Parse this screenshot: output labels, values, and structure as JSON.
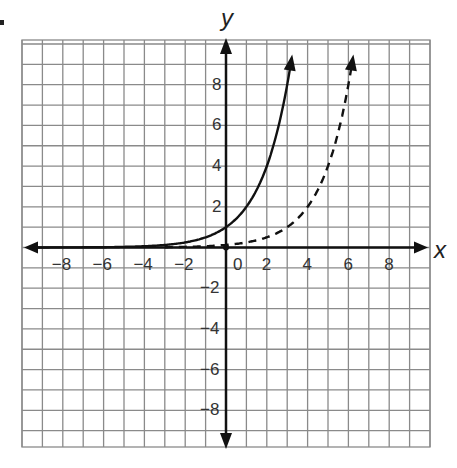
{
  "chart_data": {
    "type": "line",
    "title": "",
    "xlabel": "x",
    "ylabel": "y",
    "xlim": [
      -10,
      10
    ],
    "ylim": [
      -10,
      10
    ],
    "grid": true,
    "x_tick_labels": [
      "-8",
      "-6",
      "-4",
      "-2",
      "0",
      "2",
      "4",
      "6",
      "8"
    ],
    "y_tick_labels": [
      "8",
      "6",
      "4",
      "2",
      "-2",
      "-4",
      "-6",
      "-8"
    ],
    "series": [
      {
        "name": "solid curve",
        "style": "solid",
        "function": "y = 2^x",
        "points": [
          [
            -8,
            0.004
          ],
          [
            -4,
            0.0625
          ],
          [
            -2,
            0.25
          ],
          [
            0,
            1
          ],
          [
            1,
            2
          ],
          [
            2,
            4
          ],
          [
            3,
            8
          ],
          [
            3.32,
            10
          ]
        ]
      },
      {
        "name": "dashed curve",
        "style": "dashed",
        "function": "y = 2^(x-3)",
        "points": [
          [
            -3,
            0.016
          ],
          [
            0,
            0.125
          ],
          [
            2,
            0.5
          ],
          [
            3,
            1
          ],
          [
            4,
            2
          ],
          [
            5,
            4
          ],
          [
            6,
            8
          ],
          [
            6.32,
            10
          ]
        ]
      }
    ]
  },
  "labels": {
    "x_axis": "x",
    "y_axis": "y",
    "x_ticks": [
      {
        "text": "−8",
        "v": -8
      },
      {
        "text": "−6",
        "v": -6
      },
      {
        "text": "−4",
        "v": -4
      },
      {
        "text": "−2",
        "v": -2
      },
      {
        "text": "0",
        "v": 0
      },
      {
        "text": "2",
        "v": 2
      },
      {
        "text": "4",
        "v": 4
      },
      {
        "text": "6",
        "v": 6
      },
      {
        "text": "8",
        "v": 8
      }
    ],
    "y_ticks": [
      {
        "text": "8",
        "v": 8
      },
      {
        "text": "6",
        "v": 6
      },
      {
        "text": "4",
        "v": 4
      },
      {
        "text": "2",
        "v": 2
      },
      {
        "text": "−2",
        "v": -2
      },
      {
        "text": "−4",
        "v": -4
      },
      {
        "text": "−6",
        "v": -6
      },
      {
        "text": "−8",
        "v": -8
      }
    ]
  },
  "colors": {
    "grid": "#8a8a8a",
    "axis": "#111111",
    "curve": "#111111"
  }
}
